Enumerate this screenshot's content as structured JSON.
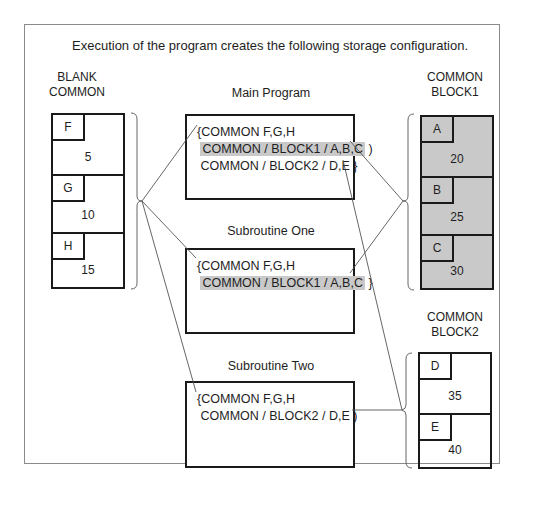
{
  "caption": "Execution of the program creates the following storage configuration.",
  "blank_common": {
    "label_line1": "BLANK",
    "label_line2": "COMMON",
    "cells": [
      {
        "name": "F",
        "value": "5"
      },
      {
        "name": "G",
        "value": "10"
      },
      {
        "name": "H",
        "value": "15"
      }
    ]
  },
  "block1": {
    "label_line1": "COMMON",
    "label_line2": "BLOCK1",
    "fill": "#c9c9c9",
    "cells": [
      {
        "name": "A",
        "value": "20"
      },
      {
        "name": "B",
        "value": "25"
      },
      {
        "name": "C",
        "value": "30"
      }
    ]
  },
  "block2": {
    "label_line1": "COMMON",
    "label_line2": "BLOCK2",
    "cells": [
      {
        "name": "D",
        "value": "35"
      },
      {
        "name": "E",
        "value": "40"
      }
    ]
  },
  "programs": {
    "main": {
      "title": "Main Program",
      "lines": [
        "COMMON F,G,H",
        "COMMON / BLOCK1 / A,B,C",
        "COMMON / BLOCK2 / D,E"
      ]
    },
    "sub_one": {
      "title": "Subroutine One",
      "lines": [
        "COMMON F,G,H",
        "COMMON / BLOCK1 / A,B,C"
      ]
    },
    "sub_two": {
      "title": "Subroutine Two",
      "lines": [
        "COMMON F,G,H",
        "COMMON / BLOCK2 / D,E"
      ]
    }
  }
}
